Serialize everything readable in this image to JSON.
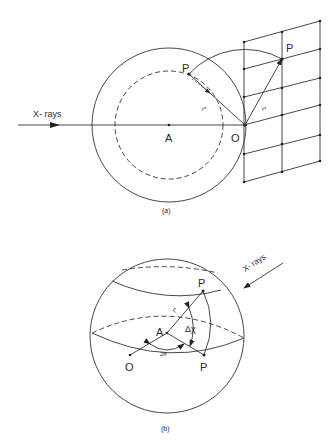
{
  "figure_a": {
    "caption": "(a)",
    "labels": {
      "xrays": "X- rays",
      "center": "A",
      "origin": "O",
      "point_inner": "P",
      "point_lattice": "P",
      "vector_inner": "r*",
      "vector_lattice": "r*"
    }
  },
  "figure_b": {
    "caption": "(b)",
    "labels": {
      "xrays": "X- rays",
      "center": "A",
      "origin": "O",
      "point_top": "P",
      "point_bottom": "P",
      "vector": "r*",
      "angle_chi": "Δχ",
      "angle_two_theta": "2θ"
    }
  }
}
